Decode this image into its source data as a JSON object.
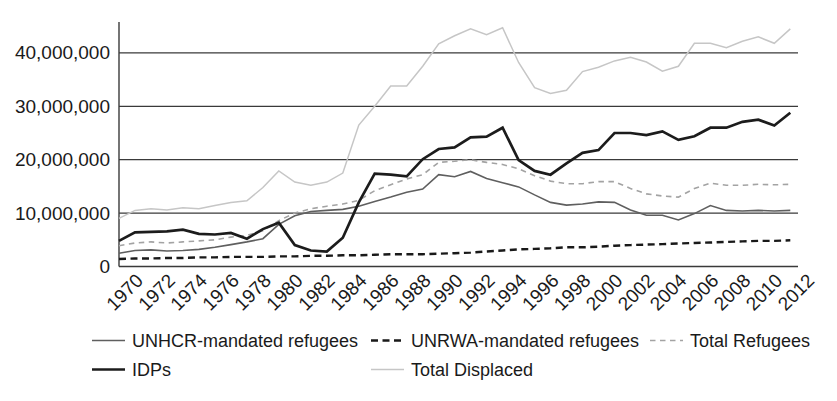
{
  "chart_data": {
    "type": "line",
    "title": "",
    "xlabel": "",
    "ylabel": "",
    "values_unit": "millions of people",
    "ylim": [
      0,
      46
    ],
    "grid": "horizontal",
    "legend_position": "bottom",
    "x": [
      1970,
      1971,
      1972,
      1973,
      1974,
      1975,
      1976,
      1977,
      1978,
      1979,
      1980,
      1981,
      1982,
      1983,
      1984,
      1985,
      1986,
      1987,
      1988,
      1989,
      1990,
      1991,
      1992,
      1993,
      1994,
      1995,
      1996,
      1997,
      1998,
      1999,
      2000,
      2001,
      2002,
      2003,
      2004,
      2005,
      2006,
      2007,
      2008,
      2009,
      2010,
      2011,
      2012
    ],
    "x_tick_labels": [
      "1970",
      "1972",
      "1974",
      "1976",
      "1978",
      "1980",
      "1982",
      "1984",
      "1986",
      "1988",
      "1990",
      "1992",
      "1994",
      "1996",
      "1998",
      "2000",
      "2002",
      "2004",
      "2006",
      "2008",
      "2010",
      "2012"
    ],
    "y_ticks": [
      {
        "value": 0,
        "label": "0"
      },
      {
        "value": 10,
        "label": "10,000,000"
      },
      {
        "value": 20,
        "label": "20,000,000"
      },
      {
        "value": 30,
        "label": "30,000,000"
      },
      {
        "value": 40,
        "label": "40,000,000"
      }
    ],
    "colors": {
      "text": "#1a1a1a",
      "grid": "#3a3a3a",
      "axis": "#3a3a3a",
      "background": "#ffffff"
    },
    "series": [
      {
        "id": "unhcr",
        "name": "UNHCR-mandated refugees",
        "color": "#5f5f5f",
        "line_style": "solid",
        "weight": "thin",
        "values": [
          2.5,
          3.0,
          3.1,
          2.9,
          3.0,
          3.2,
          3.6,
          4.1,
          4.6,
          5.2,
          7.9,
          9.5,
          10.3,
          10.5,
          10.7,
          11.3,
          12.2,
          13.0,
          13.9,
          14.5,
          17.2,
          16.8,
          17.8,
          16.5,
          15.7,
          14.9,
          13.4,
          12.0,
          11.5,
          11.7,
          12.1,
          12.0,
          10.6,
          9.6,
          9.6,
          8.7,
          9.9,
          11.4,
          10.5,
          10.4,
          10.5,
          10.4,
          10.5
        ]
      },
      {
        "id": "unrwa",
        "name": "UNRWA-mandated refugees",
        "color": "#191919",
        "line_style": "dashed_bold",
        "weight": "thick",
        "values": [
          1.4,
          1.5,
          1.5,
          1.6,
          1.6,
          1.7,
          1.7,
          1.8,
          1.8,
          1.8,
          1.9,
          1.9,
          2.0,
          2.0,
          2.1,
          2.1,
          2.2,
          2.3,
          2.3,
          2.3,
          2.4,
          2.5,
          2.6,
          2.8,
          3.0,
          3.2,
          3.3,
          3.4,
          3.6,
          3.6,
          3.7,
          3.9,
          4.0,
          4.1,
          4.2,
          4.3,
          4.4,
          4.5,
          4.6,
          4.7,
          4.8,
          4.8,
          4.9
        ]
      },
      {
        "id": "total_refugees",
        "name": "Total Refugees",
        "color": "#a3a3a3",
        "line_style": "dashed_fine",
        "weight": "thin",
        "values": [
          3.9,
          4.4,
          4.6,
          4.4,
          4.6,
          4.8,
          5.0,
          5.5,
          5.8,
          6.7,
          8.6,
          10.0,
          10.8,
          11.3,
          11.7,
          12.4,
          14.2,
          15.3,
          16.4,
          17.2,
          19.5,
          19.7,
          20.0,
          19.5,
          19.1,
          18.3,
          17.0,
          16.0,
          15.5,
          15.5,
          15.9,
          15.9,
          14.6,
          13.6,
          13.2,
          13.0,
          14.6,
          15.6,
          15.2,
          15.2,
          15.4,
          15.3,
          15.4
        ]
      },
      {
        "id": "idps",
        "name": "IDPs",
        "color": "#1c1c1c",
        "line_style": "solid",
        "weight": "thick",
        "values": [
          4.8,
          6.4,
          6.5,
          6.6,
          6.9,
          6.1,
          6.0,
          6.3,
          5.2,
          7.0,
          8.2,
          4.0,
          3.0,
          2.8,
          5.4,
          12.0,
          17.4,
          17.2,
          16.9,
          20.1,
          22.0,
          22.3,
          24.2,
          24.3,
          26.0,
          19.9,
          17.9,
          17.2,
          19.3,
          21.3,
          21.8,
          25.0,
          25.0,
          24.6,
          25.3,
          23.7,
          24.4,
          26.0,
          26.0,
          27.1,
          27.5,
          26.4,
          28.8
        ]
      },
      {
        "id": "total_displaced",
        "name": "Total Displaced",
        "color": "#c6c6c6",
        "line_style": "solid",
        "weight": "thin",
        "values": [
          9.0,
          10.5,
          10.8,
          10.6,
          11.0,
          10.8,
          11.4,
          12.0,
          12.3,
          14.8,
          17.9,
          15.8,
          15.2,
          15.8,
          17.5,
          26.5,
          30.0,
          33.8,
          33.8,
          37.5,
          41.7,
          43.2,
          44.5,
          43.4,
          44.7,
          38.2,
          33.5,
          32.4,
          33.0,
          36.5,
          37.3,
          38.5,
          39.2,
          38.3,
          36.6,
          37.5,
          41.8,
          41.8,
          41.0,
          42.2,
          43.0,
          41.8,
          44.5
        ]
      }
    ],
    "legend": [
      {
        "series": "unhcr",
        "label": "UNHCR-mandated refugees"
      },
      {
        "series": "unrwa",
        "label": "UNRWA-mandated refugees"
      },
      {
        "series": "total_refugees",
        "label": "Total Refugees"
      },
      {
        "series": "idps",
        "label": "IDPs"
      },
      {
        "series": "total_displaced",
        "label": "Total Displaced"
      }
    ]
  }
}
